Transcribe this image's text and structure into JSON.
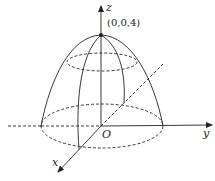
{
  "figure": {
    "labels": {
      "z_axis": "z",
      "y_axis": "y",
      "x_axis": "x",
      "origin": "O",
      "apex_point": "(0,0,4)"
    },
    "colors": {
      "line": "#222222",
      "background": "#ffffff"
    }
  }
}
